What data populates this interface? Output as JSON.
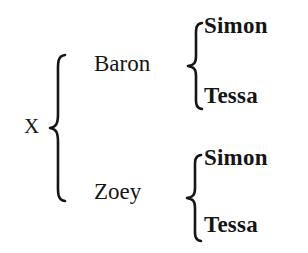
{
  "diagram": {
    "type": "hierarchical-tree-brace-diagram",
    "title": "",
    "background_color": "#ffffff",
    "text_color": "#151515",
    "root": {
      "label": "X",
      "style": "regular"
    },
    "levels": [
      {
        "name": "level-1",
        "style": "regular",
        "nodes": [
          {
            "label": "Baron"
          },
          {
            "label": "Zoey"
          }
        ]
      },
      {
        "name": "level-2",
        "style": "bold",
        "nodes": [
          {
            "label": "Simon"
          },
          {
            "label": "Tessa"
          },
          {
            "label": "Simon"
          },
          {
            "label": "Tessa"
          }
        ]
      }
    ],
    "branches": [
      {
        "parent": "X",
        "children": [
          "Baron",
          "Zoey"
        ],
        "brace": "outer-brace"
      },
      {
        "parent": "Baron",
        "children": [
          "Simon",
          "Tessa"
        ],
        "brace": "baron-brace"
      },
      {
        "parent": "Zoey",
        "children": [
          "Simon",
          "Tessa"
        ],
        "brace": "zoey-brace"
      }
    ]
  }
}
